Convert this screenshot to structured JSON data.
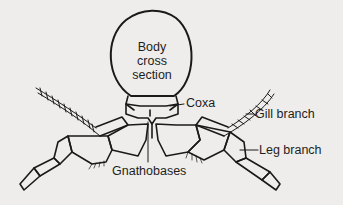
{
  "diagram": {
    "labels": {
      "body_line1": "Body",
      "body_line2": "cross",
      "body_line3": "section",
      "coxa": "Coxa",
      "gill_branch": "Gill branch",
      "leg_branch": "Leg branch",
      "gnathobases": "Gnathobases"
    },
    "colors": {
      "background": "#eeedeb",
      "stroke": "#1a1a1a",
      "text": "#1e1e1e"
    }
  }
}
